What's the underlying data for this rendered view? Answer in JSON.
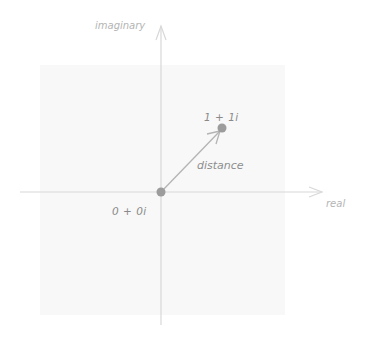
{
  "diagram": {
    "type": "complex-plane",
    "axes": {
      "horizontal": {
        "label": "real"
      },
      "vertical": {
        "label": "imaginary"
      }
    },
    "points": [
      {
        "label": "0 + 0i",
        "re": 0,
        "im": 0
      },
      {
        "label": "1 + 1i",
        "re": 1,
        "im": 1
      }
    ],
    "vector": {
      "from": "0 + 0i",
      "to": "1 + 1i",
      "label": "distance"
    },
    "colors": {
      "background": "#ffffff",
      "grid_backdrop": "#f7f7f7",
      "axis": "#d6d6d6",
      "vector": "#b0b0b0",
      "point": "#9a9a9a",
      "axis_label": "#b4b4b4",
      "point_label": "#8a8a8a"
    }
  }
}
